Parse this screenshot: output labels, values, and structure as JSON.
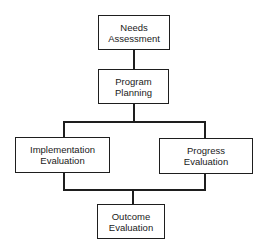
{
  "diagram": {
    "type": "flowchart",
    "nodes": [
      {
        "id": "needs",
        "lines": [
          "Needs",
          "Assessment"
        ]
      },
      {
        "id": "planning",
        "lines": [
          "Program",
          "Planning"
        ]
      },
      {
        "id": "implementation",
        "lines": [
          "Implementation",
          "Evaluation"
        ]
      },
      {
        "id": "progress",
        "lines": [
          "Progress",
          "Evaluation"
        ]
      },
      {
        "id": "outcome",
        "lines": [
          "Outcome",
          "Evaluation"
        ]
      }
    ],
    "edges": [
      {
        "from": "needs",
        "to": "planning"
      },
      {
        "from": "planning",
        "to": "implementation"
      },
      {
        "from": "planning",
        "to": "progress"
      },
      {
        "from": "implementation",
        "to": "outcome"
      },
      {
        "from": "progress",
        "to": "outcome"
      }
    ],
    "colors": {
      "stroke": "#1e1e1e",
      "background": "#ffffff"
    }
  }
}
